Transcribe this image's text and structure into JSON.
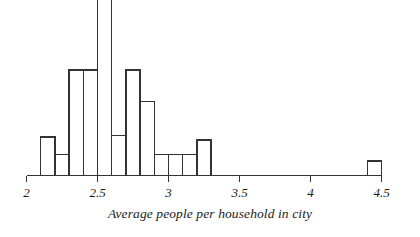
{
  "chart_data": {
    "type": "bar",
    "title": "",
    "subtitle": "",
    "xlabel": "Average people per household in city",
    "ylabel": "",
    "xlim": [
      2,
      4.5
    ],
    "ylim": [
      0,
      17
    ],
    "grid": false,
    "legend": null,
    "bin_width": 0.1,
    "xticks": [
      2,
      2.5,
      3,
      3.5,
      4,
      4.5
    ],
    "xtick_labels": [
      "2",
      "2.5",
      "3",
      "3.5",
      "4",
      "4.5"
    ],
    "categories": [
      "2.1",
      "2.2",
      "2.3",
      "2.4",
      "2.5",
      "2.6",
      "2.7",
      "2.8",
      "2.9",
      "3.0",
      "3.1",
      "3.2",
      "4.4"
    ],
    "bin_starts": [
      2.1,
      2.2,
      2.3,
      2.4,
      2.5,
      2.6,
      2.7,
      2.8,
      2.9,
      3.0,
      3.1,
      3.2,
      4.4
    ],
    "values": [
      4,
      2.2,
      11,
      11,
      20,
      4.2,
      11,
      7.7,
      2.2,
      2.2,
      2.2,
      3.7,
      1.5
    ],
    "colors": {
      "bar_fill": "#ffffff",
      "bar_stroke": "#333333",
      "axis": "#333333",
      "text": "#1a1a1a",
      "background": "#ffffff"
    }
  }
}
